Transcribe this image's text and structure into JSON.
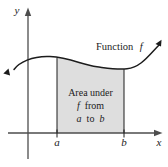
{
  "figure": {
    "labels": {
      "y_axis": "y",
      "x_axis": "x",
      "tick_a": "a",
      "tick_b": "b"
    },
    "curve_label": {
      "word": "Function",
      "f": "f"
    },
    "area_label": {
      "line1": "Area under",
      "line2_f": "f",
      "line2_rest": "from",
      "line3_a": "a",
      "line3_mid": "to",
      "line3_b": "b"
    },
    "colors": {
      "background": "#ffffff",
      "area_fill": "#dedede",
      "curve": "#1c1c1c",
      "axis": "#4d4d4d",
      "text": "#1c1c1c"
    }
  }
}
